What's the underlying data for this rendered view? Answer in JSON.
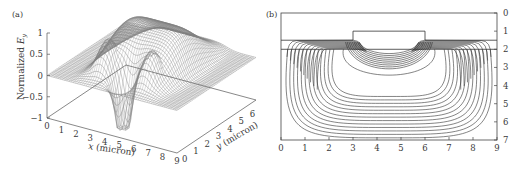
{
  "figure": {
    "panels": [
      {
        "id": "a",
        "label": "(a)"
      },
      {
        "id": "b",
        "label": "(b)"
      }
    ]
  },
  "chart_data": [
    {
      "type": "surface",
      "panel": "(a)",
      "title": "",
      "zlabel": "Normalized E_y",
      "zlabel_main": "Normalized ",
      "zlabel_var": "E",
      "zlabel_sub": "y",
      "xlabel": "x (micron)",
      "ylabel": "y (micron)",
      "zticks": [
        "1",
        "0.5",
        "0",
        "−0.5",
        "−1"
      ],
      "xticks": [
        "0",
        "1",
        "2",
        "3",
        "4",
        "5",
        "6",
        "7",
        "8",
        "9"
      ],
      "yticks": [
        "0",
        "1",
        "2",
        "3",
        "4",
        "5",
        "6",
        "7"
      ],
      "zlim": [
        -1,
        1
      ],
      "xlim": [
        0,
        9
      ],
      "ylim": [
        0,
        7
      ],
      "description": "Mesh surface of normalized Ey field: broad positive lobe (max ~1) centered near x=4.5, with two side peaks (~0.8) near x=3 and x=6, and a negative dip (~-1) near x=4.5 at the front edge; flat near 0 elsewhere"
    },
    {
      "type": "contour",
      "panel": "(b)",
      "xticks": [
        "0",
        "1",
        "2",
        "3",
        "4",
        "5",
        "6",
        "7",
        "8",
        "9"
      ],
      "yticks_right": [
        "0",
        "1",
        "2",
        "3",
        "4",
        "5",
        "6",
        "7"
      ],
      "xlim": [
        0,
        9
      ],
      "ylim": [
        7,
        0
      ],
      "structure": {
        "ridge_x": [
          3,
          6
        ],
        "ridge_top_y": 1.0,
        "layer_interfaces_y": [
          1.5,
          2.0
        ]
      },
      "description": "Contour lines of field: dense contours along layer interface y≈1.5–2; inner bowl-shaped contours under ridge (x 3–6) down to y≈3.7; outer U-shaped contours spanning x 0–9 down to y≈7"
    }
  ]
}
